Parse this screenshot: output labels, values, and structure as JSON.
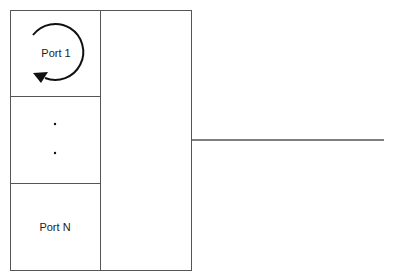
{
  "diagram": {
    "ports": [
      {
        "label": "Port 1",
        "has_loop_arrow": true
      },
      {
        "label": "·"
      },
      {
        "label": "·"
      },
      {
        "label": "Port N"
      }
    ],
    "colors": {
      "stroke": "#444444",
      "text": "#222222"
    }
  }
}
